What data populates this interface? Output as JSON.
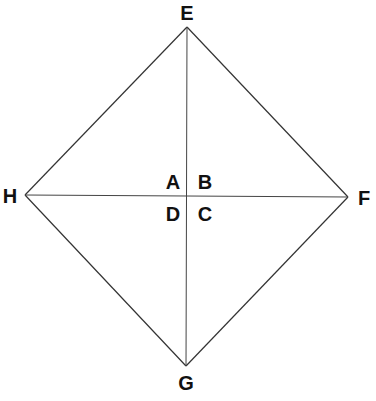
{
  "diagram": {
    "type": "rhombus-with-diagonals",
    "stroke_color": "#333333",
    "vertices": {
      "E": {
        "label": "E",
        "x": 187,
        "y": 27
      },
      "F": {
        "label": "F",
        "x": 348,
        "y": 197
      },
      "G": {
        "label": "G",
        "x": 186,
        "y": 366
      },
      "H": {
        "label": "H",
        "x": 25,
        "y": 195
      }
    },
    "center": {
      "x": 187,
      "y": 196
    },
    "quadrant_labels": {
      "A": "A",
      "B": "B",
      "C": "C",
      "D": "D"
    },
    "edges": [
      [
        "E",
        "F"
      ],
      [
        "F",
        "G"
      ],
      [
        "G",
        "H"
      ],
      [
        "H",
        "E"
      ]
    ],
    "diagonals": [
      [
        "E",
        "G"
      ],
      [
        "H",
        "F"
      ]
    ]
  }
}
